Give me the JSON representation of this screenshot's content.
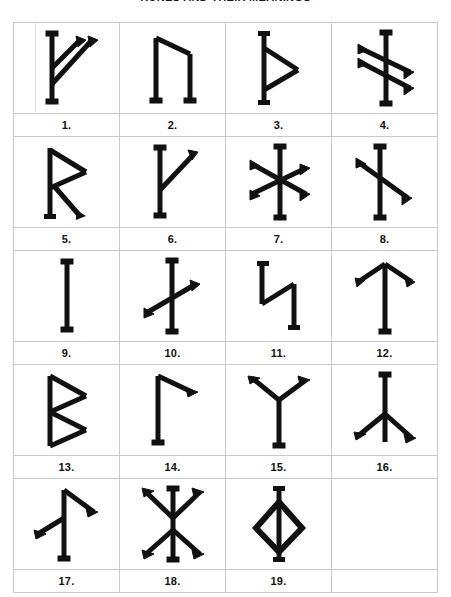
{
  "page": {
    "title": "RUNES AND THEIR MEANINGS",
    "title_visible_note": "cropped at top edge",
    "background_color": "#ffffff",
    "ink_color": "#111111",
    "grid_line_color": "#c9c9c9"
  },
  "chart": {
    "columns": 4,
    "glyph_rows": 5,
    "total_cells": 20,
    "filled_cells": 19
  },
  "runes": [
    {
      "number": "1.",
      "name": "fehu-rune",
      "strokes": "stem with two upward-right diagonals"
    },
    {
      "number": "2.",
      "name": "uruz-rune",
      "strokes": "two stems joined by upper diagonal"
    },
    {
      "number": "3.",
      "name": "thurisaz-rune",
      "strokes": "stem with triangle on right"
    },
    {
      "number": "4.",
      "name": "ansuz-double-rune",
      "strokes": "stem with two parallel downward diagonals"
    },
    {
      "number": "5.",
      "name": "raidho-rune",
      "strokes": "stem with loop and leg"
    },
    {
      "number": "6.",
      "name": "kenaz-rune",
      "strokes": "stem with single upward-right diagonal"
    },
    {
      "number": "7.",
      "name": "hagalaz-star-rune",
      "strokes": "stem crossed by two full diagonals"
    },
    {
      "number": "8.",
      "name": "naudiz-rune",
      "strokes": "stem with one full descending diagonal"
    },
    {
      "number": "9.",
      "name": "isaz-rune",
      "strokes": "single vertical stem"
    },
    {
      "number": "10.",
      "name": "nauthiz-rune",
      "strokes": "stem with short rising cross stroke"
    },
    {
      "number": "11.",
      "name": "jera-rune",
      "strokes": "zig-zag two-part figure"
    },
    {
      "number": "12.",
      "name": "elhaz-rune",
      "strokes": "stem with two downward arms from apex"
    },
    {
      "number": "13.",
      "name": "berkana-rune",
      "strokes": "stem with two triangular bows"
    },
    {
      "number": "14.",
      "name": "laguz-rune",
      "strokes": "stem with short arm at top right"
    },
    {
      "number": "15.",
      "name": "algiz-rune",
      "strokes": "stem with two upward arms forming Y"
    },
    {
      "number": "16.",
      "name": "inverted-elhaz-rune",
      "strokes": "stem with two downward arms at base"
    },
    {
      "number": "17.",
      "name": "tiwaz-variant-rune",
      "strokes": "stem with upper-right and lower-left arms"
    },
    {
      "number": "18.",
      "name": "double-cross-rune",
      "strokes": "stem with X crossings top and bottom"
    },
    {
      "number": "19.",
      "name": "ingwaz-rune",
      "strokes": "stem through a diamond"
    },
    {
      "number": "",
      "name": "empty-cell",
      "strokes": ""
    }
  ]
}
